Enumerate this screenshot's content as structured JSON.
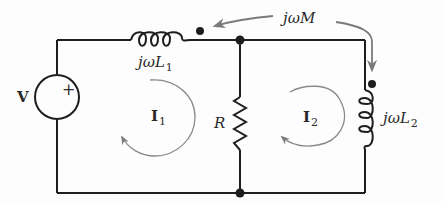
{
  "diagram": {
    "title": "",
    "type": "circuit",
    "colors": {
      "wire": "#1e1e1e",
      "arrow": "#7a7a7a",
      "text": "#2a2a2a"
    },
    "components": {
      "source": {
        "label": "V",
        "polarity": "+"
      },
      "inductor1": {
        "label_main": "jωL",
        "label_sub": "1"
      },
      "resistor": {
        "label": "R"
      },
      "inductor2": {
        "label_main": "jωL",
        "label_sub": "2"
      },
      "mutual": {
        "label": "jωM"
      }
    },
    "mesh_currents": [
      {
        "label_main": "I",
        "label_sub": "1",
        "direction": "clockwise"
      },
      {
        "label_main": "I",
        "label_sub": "2",
        "direction": "clockwise"
      }
    ]
  }
}
